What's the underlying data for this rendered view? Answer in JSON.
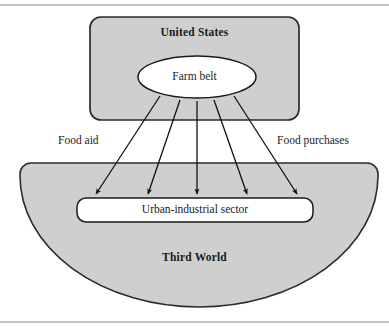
{
  "figure": {
    "type": "concept-diagram",
    "caption_rules": {
      "top_rule_y": 5,
      "bottom_rule_y": 322
    }
  },
  "nodes": {
    "united_states": {
      "label": "United States",
      "shape": "rounded-rectangle",
      "fill": "#cfcfcf",
      "stroke": "#2b2b2b",
      "x": 90,
      "y": 17,
      "width": 209,
      "height": 103
    },
    "farm_belt": {
      "label": "Farm belt",
      "shape": "ellipse",
      "fill": "#ffffff",
      "stroke": "#1a1a1a",
      "cx": 197,
      "cy": 77,
      "rx": 59,
      "ry": 21
    },
    "third_world": {
      "label": "Third World",
      "shape": "semicircle",
      "fill": "#cfcfcf",
      "stroke": "#2b2b2b",
      "x": 20,
      "y": 163,
      "width": 358,
      "height": 141
    },
    "urban_industrial_sector": {
      "label": "Urban-industrial sector",
      "shape": "rounded-rectangle",
      "fill": "#ffffff",
      "stroke": "#1a1a1a",
      "x": 77,
      "y": 198,
      "width": 236,
      "height": 24
    }
  },
  "edge_labels": {
    "left": "Food aid",
    "right": "Food purchases"
  },
  "arrows": [
    {
      "x1": 160,
      "y1": 96,
      "x2": 96,
      "y2": 196
    },
    {
      "x1": 180,
      "y1": 100,
      "x2": 148,
      "y2": 196
    },
    {
      "x1": 197,
      "y1": 101,
      "x2": 197,
      "y2": 196
    },
    {
      "x1": 214,
      "y1": 100,
      "x2": 247,
      "y2": 196
    },
    {
      "x1": 234,
      "y1": 96,
      "x2": 297,
      "y2": 196
    }
  ],
  "colors": {
    "gray_fill": "#cfcfcf",
    "white_fill": "#ffffff",
    "stroke_dark": "#1a1a1a",
    "rule_gray": "#8a8a8a",
    "page_background": "#ffffff"
  }
}
